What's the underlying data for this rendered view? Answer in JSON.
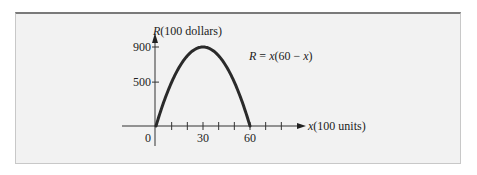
{
  "chart_data": {
    "type": "line",
    "title": "",
    "xlabel": "x(100 units)",
    "ylabel": "R(100 dollars)",
    "xlim": [
      0,
      60
    ],
    "ylim": [
      0,
      900
    ],
    "x_ticks": [
      10,
      20,
      30,
      40,
      50,
      60,
      70,
      80
    ],
    "x_tick_labels": [
      {
        "value": 0,
        "label": "0"
      },
      {
        "value": 30,
        "label": "30"
      },
      {
        "value": 60,
        "label": "60"
      }
    ],
    "y_tick_labels": [
      {
        "value": 500,
        "label": "500"
      },
      {
        "value": 900,
        "label": "900"
      }
    ],
    "grid": false,
    "legend": "none",
    "series": [
      {
        "name": "R = x(60 − x)",
        "equation": "R = x(60 - x)",
        "x": [
          0,
          5,
          10,
          15,
          20,
          25,
          30,
          35,
          40,
          45,
          50,
          55,
          60
        ],
        "values": [
          0,
          275,
          500,
          675,
          800,
          875,
          900,
          875,
          800,
          675,
          500,
          275,
          0
        ]
      }
    ],
    "annotations": [
      {
        "text_italic": "R",
        "text_rest": " = ",
        "text_italic2": "x",
        "text_tail": "(60 − ",
        "text_italic3": "x",
        "text_end": ")"
      }
    ]
  }
}
